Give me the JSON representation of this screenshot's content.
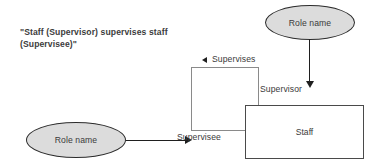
{
  "diagram": {
    "caption": {
      "line1": "\"Staff (Supervisor) supervises staff",
      "line2": "(Supervisee)\""
    },
    "nodes": {
      "ellipse_top": {
        "label": "Role name"
      },
      "ellipse_bottom": {
        "label": "Role name"
      },
      "rect_staff": {
        "label": "Staff"
      },
      "rect_supervises": {
        "label": ""
      }
    },
    "labels": {
      "supervises": "Supervises",
      "supervisor": "Supervisor",
      "supervisee": "Supervisee"
    },
    "colors": {
      "ellipse_fill": "#dcdcdc",
      "ellipse_stroke": "#2b2b2b",
      "rect_fill": "#ffffff",
      "rect_stroke_light": "#8a8a8a",
      "rect_stroke_dark": "#4a4a4a",
      "line": "#1f1f1f",
      "text": "#3a3a3a",
      "background": "#ffffff"
    }
  }
}
